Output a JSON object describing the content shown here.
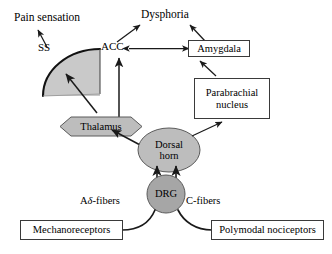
{
  "figure": {
    "background_color": "#ffffff",
    "line_color": "#1a1a1a",
    "fill_gray_light": "#c9c9c9",
    "fill_gray_mid": "#bdbdbd",
    "fill_gray_dark": "#a6a6a6",
    "box_border_color": "#3a3a3a"
  },
  "outputs": {
    "pain_sensation": "Pain sensation",
    "dysphoria": "Dysphoria"
  },
  "cortex": {
    "ss_label": "SS",
    "acc_label": "ACC"
  },
  "nuclei": {
    "thalamus": "Thalamus",
    "dorsal_horn_line1": "Dorsal",
    "dorsal_horn_line2": "horn",
    "drg": "DRG"
  },
  "boxes": {
    "amygdala": "Amygdala",
    "parabrachial_line1": "Parabrachial",
    "parabrachial_line2": "nucleus",
    "mechanoreceptors": "Mechanoreceptors",
    "polymodal_nociceptors": "Polymodal nociceptors"
  },
  "fibers": {
    "a_delta_prefix": "A",
    "a_delta_symbol": "δ",
    "a_delta_suffix": "-fibers",
    "c_fibers": "C-fibers"
  },
  "connections": [
    {
      "from": "SS cortex",
      "to": "Pain sensation",
      "type": "arrow"
    },
    {
      "from": "ACC",
      "to": "Dysphoria",
      "type": "arrow"
    },
    {
      "from": "Amygdala",
      "to": "Dysphoria",
      "type": "arrow"
    },
    {
      "from": "ACC",
      "to": "Amygdala",
      "type": "double-arrow"
    },
    {
      "from": "Thalamus",
      "to": "SS cortex",
      "type": "arrow"
    },
    {
      "from": "Thalamus",
      "to": "ACC",
      "type": "arrow"
    },
    {
      "from": "Dorsal horn",
      "to": "Thalamus",
      "type": "arrow"
    },
    {
      "from": "Dorsal horn",
      "to": "Parabrachial nucleus",
      "type": "arrow"
    },
    {
      "from": "Parabrachial nucleus",
      "to": "Amygdala",
      "type": "arrow"
    },
    {
      "from": "DRG",
      "to": "Dorsal horn",
      "type": "double-parallel-arrow"
    },
    {
      "from": "Mechanoreceptors",
      "to": "DRG",
      "type": "curve",
      "label": "Aδ-fibers"
    },
    {
      "from": "Polymodal nociceptors",
      "to": "DRG",
      "type": "curve",
      "label": "C-fibers"
    }
  ]
}
